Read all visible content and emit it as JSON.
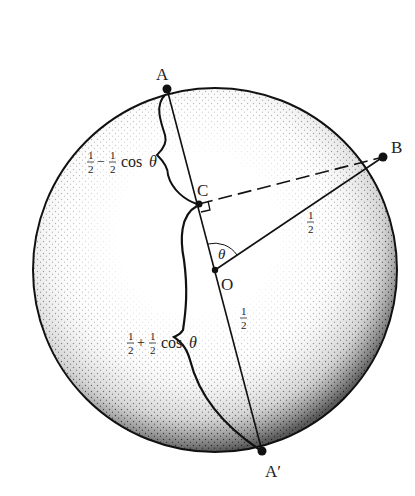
{
  "diagram": {
    "circle": {
      "cx": 215,
      "cy": 270,
      "r": 182,
      "stipple_color": "#1a1a1a"
    },
    "points": {
      "A": {
        "label": "A",
        "x": 167,
        "y": 89
      },
      "A_prime": {
        "label": "A′",
        "x": 262,
        "y": 451
      },
      "B": {
        "label": "B",
        "x": 383,
        "y": 157
      },
      "C": {
        "label": "C",
        "x": 199,
        "y": 204
      },
      "O": {
        "label": "O",
        "x": 215,
        "y": 270
      }
    },
    "labels": {
      "upper_segment": {
        "half1": "1",
        "half1_den": "2",
        "op": "−",
        "half2": "1",
        "half2_den": "2",
        "tail": "cos",
        "theta": "θ"
      },
      "lower_segment": {
        "half1": "1",
        "half1_den": "2",
        "op": "+",
        "half2": "1",
        "half2_den": "2",
        "tail": "cos",
        "theta": "θ"
      },
      "ob_length": {
        "num": "1",
        "den": "2"
      },
      "oa_prime_length": {
        "num": "1",
        "den": "2"
      },
      "angle": "θ"
    }
  }
}
